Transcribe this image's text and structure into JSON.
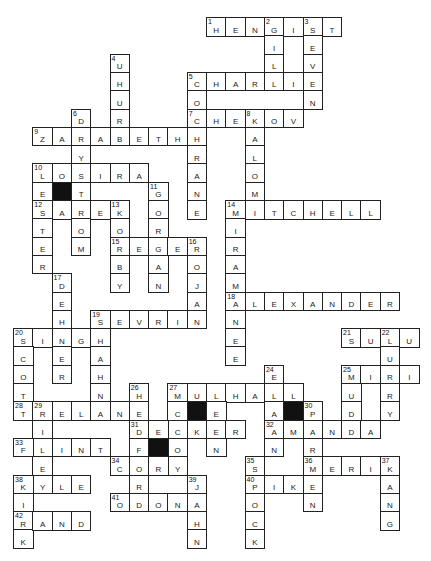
{
  "puzzle": {
    "grid": {
      "origin_x": 13,
      "origin_y": 17,
      "cell_w": 19.3,
      "cell_h": 18.3
    },
    "entries": [
      {
        "num": "1",
        "dir": "across",
        "row": 0,
        "col": 10,
        "answer": "HENGIST"
      },
      {
        "num": "2",
        "dir": "down",
        "row": 0,
        "col": 13,
        "answer": "GILL"
      },
      {
        "num": "3",
        "dir": "down",
        "row": 0,
        "col": 15,
        "answer": "SEVEN"
      },
      {
        "num": "4",
        "dir": "down",
        "row": 2,
        "col": 5,
        "answer": "UHURA"
      },
      {
        "num": "5",
        "dir": "across",
        "row": 3,
        "col": 9,
        "answer": "CHARLIE"
      },
      {
        "num": "5",
        "dir": "down",
        "row": 3,
        "col": 9,
        "answer": "COCHRANE"
      },
      {
        "num": "6",
        "dir": "down",
        "row": 5,
        "col": 3,
        "answer": "DAYSTROM"
      },
      {
        "num": "7",
        "dir": "across",
        "row": 5,
        "col": 9,
        "answer": "CHEKOV"
      },
      {
        "num": "8",
        "dir": "down",
        "row": 5,
        "col": 12,
        "answer": "KALOMI"
      },
      {
        "num": "9",
        "dir": "across",
        "row": 6,
        "col": 1,
        "answer": "ZARABETH"
      },
      {
        "num": "10",
        "dir": "across",
        "row": 8,
        "col": 1,
        "answer": "LOSIRA"
      },
      {
        "num": "10",
        "dir": "down",
        "row": 8,
        "col": 1,
        "answer": "LESTER"
      },
      {
        "num": "11",
        "dir": "down",
        "row": 9,
        "col": 7,
        "answer": "GORGAN"
      },
      {
        "num": "12",
        "dir": "across",
        "row": 10,
        "col": 1,
        "answer": "SAREK"
      },
      {
        "num": "13",
        "dir": "down",
        "row": 10,
        "col": 5,
        "answer": "KORBY"
      },
      {
        "num": "14",
        "dir": "across",
        "row": 10,
        "col": 11,
        "answer": "MITCHELL"
      },
      {
        "num": "14",
        "dir": "down",
        "row": 10,
        "col": 11,
        "answer": "MIRAMANEE"
      },
      {
        "num": "15",
        "dir": "across",
        "row": 12,
        "col": 5,
        "answer": "REGER"
      },
      {
        "num": "16",
        "dir": "down",
        "row": 12,
        "col": 9,
        "answer": "ROJAN"
      },
      {
        "num": "17",
        "dir": "down",
        "row": 14,
        "col": 2,
        "answer": "DEHNER"
      },
      {
        "num": "18",
        "dir": "across",
        "row": 15,
        "col": 11,
        "answer": "ALEXANDER"
      },
      {
        "num": "19",
        "dir": "across",
        "row": 16,
        "col": 4,
        "answer": "SEVRIN"
      },
      {
        "num": "19",
        "dir": "down",
        "row": 16,
        "col": 4,
        "answer": "SHAHN"
      },
      {
        "num": "20",
        "dir": "across",
        "row": 17,
        "col": 0,
        "answer": "SINGH"
      },
      {
        "num": "20",
        "dir": "down",
        "row": 17,
        "col": 0,
        "answer": "SCOTT"
      },
      {
        "num": "21",
        "dir": "across",
        "row": 17,
        "col": 17,
        "answer": "SULU"
      },
      {
        "num": "22",
        "dir": "down",
        "row": 17,
        "col": 19,
        "answer": "LURRY"
      },
      {
        "num": "24",
        "dir": "down",
        "row": 19,
        "col": 13,
        "answer": "ELAAN"
      },
      {
        "num": "25",
        "dir": "across",
        "row": 19,
        "col": 17,
        "answer": "MIRI"
      },
      {
        "num": "25",
        "dir": "down",
        "row": 19,
        "col": 17,
        "answer": "MUDD"
      },
      {
        "num": "26",
        "dir": "down",
        "row": 20,
        "col": 6,
        "answer": "HEDFORD"
      },
      {
        "num": "27",
        "dir": "across",
        "row": 20,
        "col": 8,
        "answer": "MULHALL"
      },
      {
        "num": "27",
        "dir": "down",
        "row": 20,
        "col": 8,
        "answer": "MCCOY"
      },
      {
        "num": "",
        "dir": "down",
        "row": 20,
        "col": 10,
        "answer": "LEEN"
      },
      {
        "num": "28",
        "dir": "across",
        "row": 21,
        "col": 0,
        "answer": "TRELANE"
      },
      {
        "num": "29",
        "dir": "down",
        "row": 21,
        "col": 1,
        "answer": "RILEY"
      },
      {
        "num": "30",
        "dir": "down",
        "row": 21,
        "col": 15,
        "answer": "PARMEN"
      },
      {
        "num": "31",
        "dir": "across",
        "row": 22,
        "col": 6,
        "answer": "DECKER"
      },
      {
        "num": "32",
        "dir": "across",
        "row": 22,
        "col": 13,
        "answer": "AMANDA"
      },
      {
        "num": "33",
        "dir": "across",
        "row": 23,
        "col": 0,
        "answer": "FLINT"
      },
      {
        "num": "34",
        "dir": "across",
        "row": 24,
        "col": 5,
        "answer": "CORY"
      },
      {
        "num": "35",
        "dir": "down",
        "row": 24,
        "col": 12,
        "answer": "SPOCK"
      },
      {
        "num": "36",
        "dir": "across",
        "row": 24,
        "col": 15,
        "answer": "MERIK"
      },
      {
        "num": "37",
        "dir": "down",
        "row": 24,
        "col": 19,
        "answer": "KANG"
      },
      {
        "num": "38",
        "dir": "across",
        "row": 25,
        "col": 0,
        "answer": "KYLE"
      },
      {
        "num": "38",
        "dir": "down",
        "row": 25,
        "col": 0,
        "answer": "KIRK"
      },
      {
        "num": "39",
        "dir": "down",
        "row": 25,
        "col": 9,
        "answer": "JAHN"
      },
      {
        "num": "40",
        "dir": "across",
        "row": 25,
        "col": 12,
        "answer": "PIKE"
      },
      {
        "num": "41",
        "dir": "across",
        "row": 26,
        "col": 5,
        "answer": "ODONA"
      },
      {
        "num": "42",
        "dir": "across",
        "row": 27,
        "col": 0,
        "answer": "RAND"
      }
    ],
    "black_cells": [
      {
        "row": 9,
        "col": 2
      },
      {
        "row": 21,
        "col": 9
      },
      {
        "row": 21,
        "col": 14
      },
      {
        "row": 23,
        "col": 7
      }
    ]
  }
}
